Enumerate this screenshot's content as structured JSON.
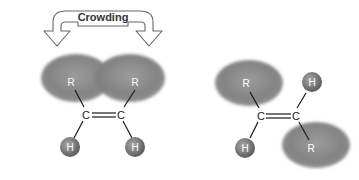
{
  "diagram": {
    "arrow": {
      "label": "Crowding"
    },
    "cis": {
      "substituent_top_left": "R",
      "substituent_top_right": "R",
      "carbon_left": "C",
      "carbon_right": "C",
      "substituent_bottom_left": "H",
      "substituent_bottom_right": "H"
    },
    "trans": {
      "substituent_top_left": "R",
      "substituent_top_right": "H",
      "carbon_left": "C",
      "carbon_right": "C",
      "substituent_bottom_left": "H",
      "substituent_bottom_right": "R"
    },
    "colors": {
      "r_group": "#8a8a8a",
      "h_atom": "#7a7a7a",
      "bond": "#1a1a1a",
      "arrow_stroke": "#666666"
    }
  }
}
